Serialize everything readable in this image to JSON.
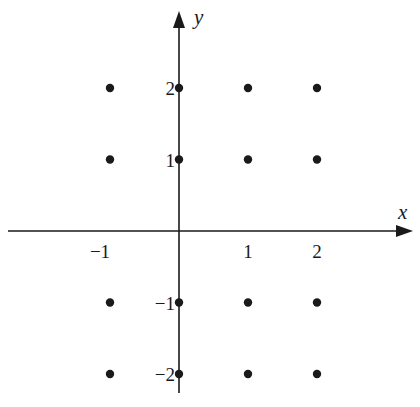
{
  "chart_data": {
    "type": "scatter",
    "title": "",
    "xlabel": "x",
    "ylabel": "y",
    "x_ticks": [
      -1,
      1,
      2
    ],
    "y_ticks": [
      2,
      1,
      -1,
      -2
    ],
    "x_tick_labels": [
      "−1",
      "1",
      "2"
    ],
    "y_tick_labels": [
      "2",
      "1",
      "−1",
      "−2"
    ],
    "grid": false,
    "legend": null,
    "points": [
      {
        "x": -1,
        "y": 2
      },
      {
        "x": 0,
        "y": 2
      },
      {
        "x": 1,
        "y": 2
      },
      {
        "x": 2,
        "y": 2
      },
      {
        "x": -1,
        "y": 1
      },
      {
        "x": 0,
        "y": 1
      },
      {
        "x": 1,
        "y": 1
      },
      {
        "x": 2,
        "y": 1
      },
      {
        "x": -1,
        "y": -1
      },
      {
        "x": 0,
        "y": -1
      },
      {
        "x": 1,
        "y": -1
      },
      {
        "x": 2,
        "y": -1
      },
      {
        "x": -1,
        "y": -2
      },
      {
        "x": 0,
        "y": -2
      },
      {
        "x": 1,
        "y": -2
      },
      {
        "x": 2,
        "y": -2
      }
    ],
    "xlim": [
      -2.5,
      3.4
    ],
    "ylim": [
      -2.3,
      3.2
    ]
  },
  "colors": {
    "ink": "#1a1a1a",
    "background": "#ffffff"
  }
}
